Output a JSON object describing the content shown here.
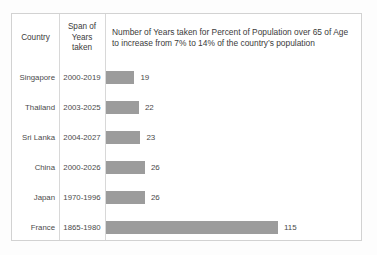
{
  "table": {
    "headers": {
      "country": "Country",
      "span_line1": "Span of",
      "span_line2": "Years",
      "span_line3": "taken",
      "metric": "Number of Years taken for  Percent of Population over 65 of Age to increase from 7% to 14% of the country’s population"
    },
    "rows": [
      {
        "country": "Singapore",
        "span": "2000-2019",
        "years": 19
      },
      {
        "country": "Thailand",
        "span": "2003-2025",
        "years": 22
      },
      {
        "country": "Sri Lanka",
        "span": "2004-2027",
        "years": 23
      },
      {
        "country": "China",
        "span": "2000-2026",
        "years": 26
      },
      {
        "country": "Japan",
        "span": "1970-1996",
        "years": 26
      },
      {
        "country": "France",
        "span": "1865-1980",
        "years": 115
      }
    ]
  },
  "chart_data": {
    "type": "bar",
    "orientation": "horizontal",
    "title": "Number of Years taken for  Percent of Population over 65 of Age to increase from 7% to 14% of the country’s population",
    "categories": [
      "Singapore",
      "Thailand",
      "Sri Lanka",
      "China",
      "Japan",
      "France"
    ],
    "values": [
      19,
      22,
      23,
      26,
      26,
      115
    ],
    "value_labels": [
      "19",
      "22",
      "22",
      "26",
      "26",
      "115"
    ],
    "spans": [
      "2000-2019",
      "2003-2025",
      "2004-2027",
      "2000-2026",
      "1970-1996",
      "1865-1980"
    ],
    "xlabel": "",
    "ylabel": "",
    "xlim": [
      0,
      115
    ],
    "grid": false,
    "legend": "none",
    "bar_color": "#9c9c9c",
    "max_bar_px": 172
  },
  "style": {
    "border_color": "#d2d2d2",
    "divider_color": "#d8d8d8",
    "text_color": "#3b3b3b",
    "bar_color": "#9c9c9c",
    "background": "#ffffff"
  }
}
